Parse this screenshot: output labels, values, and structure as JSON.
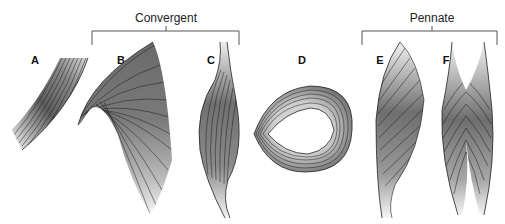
{
  "groups": [
    {
      "id": "convergent",
      "title": "Convergent",
      "x_start": 92,
      "x_end": 239,
      "center": 166
    },
    {
      "id": "pennate",
      "title": "Pennate",
      "x_start": 362,
      "x_end": 497,
      "center": 432
    }
  ],
  "panels": [
    {
      "label": "A",
      "shape": "parallel",
      "x": 35
    },
    {
      "label": "B",
      "shape": "convergent-fan",
      "x": 121
    },
    {
      "label": "C",
      "shape": "fusiform",
      "x": 211
    },
    {
      "label": "D",
      "shape": "circular",
      "x": 302
    },
    {
      "label": "E",
      "shape": "unipennate",
      "x": 380
    },
    {
      "label": "F",
      "shape": "bipennate",
      "x": 446
    }
  ],
  "colors": {
    "fill_dark": "#6a6a6a",
    "fill_light": "#f2f2f2",
    "fiber_line": "#1a1a1a",
    "bracket": "#555555"
  }
}
